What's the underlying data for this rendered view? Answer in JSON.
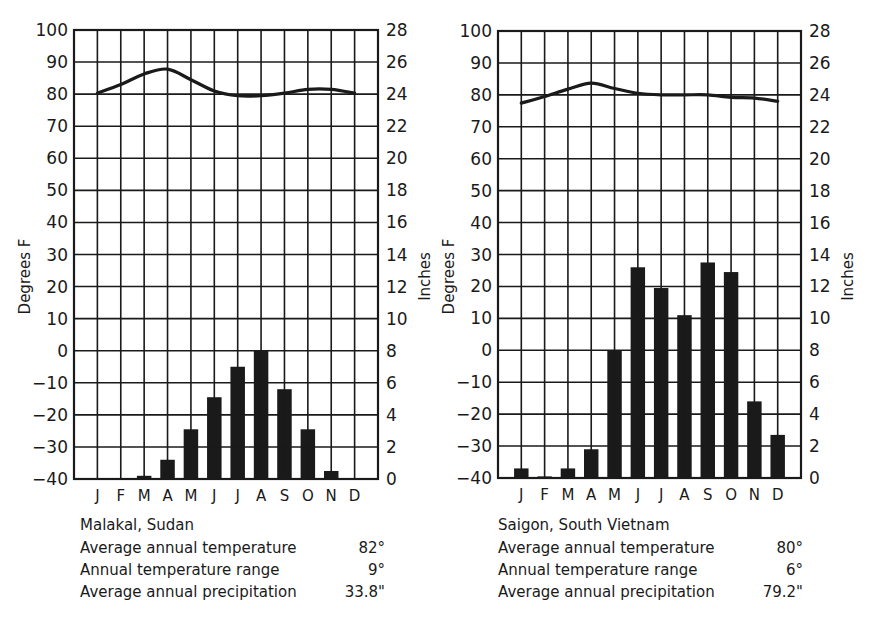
{
  "figure": {
    "background": "#ffffff",
    "ink_color": "#1a1a1a"
  },
  "captions": [
    {
      "station": "Malakal, Sudan",
      "rows": [
        {
          "label": "Average annual temperature",
          "value": "82°"
        },
        {
          "label": "Annual temperature range",
          "value": "9°"
        },
        {
          "label": "Average annual precipitation",
          "value": "33.8\""
        }
      ]
    },
    {
      "station": "Saigon, South Vietnam",
      "rows": [
        {
          "label": "Average annual temperature",
          "value": "80°"
        },
        {
          "label": "Annual temperature range",
          "value": "6°"
        },
        {
          "label": "Average annual precipitation",
          "value": "79.2\""
        }
      ]
    }
  ],
  "chart_data": [
    {
      "type": "bar+line",
      "title": "Malakal, Sudan",
      "categories": [
        "J",
        "F",
        "M",
        "A",
        "M",
        "J",
        "J",
        "A",
        "S",
        "O",
        "N",
        "D"
      ],
      "series": [
        {
          "name": "Precipitation (inches)",
          "type": "bar",
          "axis": "right",
          "values": [
            0,
            0,
            0.2,
            1.2,
            3.1,
            5.1,
            7.0,
            8.0,
            5.6,
            3.1,
            0.5,
            0
          ]
        },
        {
          "name": "Temperature (°F)",
          "type": "line",
          "axis": "left",
          "values": [
            80.3,
            83,
            86.3,
            87.8,
            84.5,
            81,
            79.5,
            79.5,
            80.3,
            81.5,
            81.5,
            80.3
          ]
        }
      ],
      "ylabel": "Degrees F",
      "y2label": "Inches",
      "ylim": [
        -40,
        100
      ],
      "y2lim": [
        0,
        28
      ],
      "yticks": [
        "100",
        "90",
        "80",
        "70",
        "60",
        "50",
        "40",
        "30",
        "20",
        "10",
        "0",
        "-10",
        "-20",
        "-30",
        "-40"
      ],
      "y2ticks": [
        "28",
        "26",
        "24",
        "22",
        "20",
        "18",
        "16",
        "14",
        "12",
        "10",
        "8",
        "6",
        "4",
        "2",
        "0"
      ],
      "grid": true,
      "legend": "none"
    },
    {
      "type": "bar+line",
      "title": "Saigon, South Vietnam",
      "categories": [
        "J",
        "F",
        "M",
        "A",
        "M",
        "J",
        "J",
        "A",
        "S",
        "O",
        "N",
        "D"
      ],
      "series": [
        {
          "name": "Precipitation (inches)",
          "type": "bar",
          "axis": "right",
          "values": [
            0.6,
            0.1,
            0.6,
            1.8,
            8.0,
            13.2,
            11.9,
            10.2,
            13.5,
            12.9,
            4.8,
            2.7
          ]
        },
        {
          "name": "Temperature (°F)",
          "type": "line",
          "axis": "left",
          "values": [
            77.4,
            79.5,
            81.8,
            83.7,
            82,
            80.5,
            80,
            80,
            80,
            79.2,
            79,
            78
          ]
        }
      ],
      "ylabel": "Degrees F",
      "y2label": "Inches",
      "ylim": [
        -40,
        100
      ],
      "y2lim": [
        0,
        28
      ],
      "yticks": [
        "100",
        "90",
        "80",
        "70",
        "60",
        "50",
        "40",
        "30",
        "20",
        "10",
        "0",
        "-10",
        "-20",
        "-30",
        "-40"
      ],
      "y2ticks": [
        "28",
        "26",
        "24",
        "22",
        "20",
        "18",
        "16",
        "14",
        "12",
        "10",
        "8",
        "6",
        "4",
        "2",
        "0"
      ],
      "grid": true,
      "legend": "none"
    }
  ]
}
